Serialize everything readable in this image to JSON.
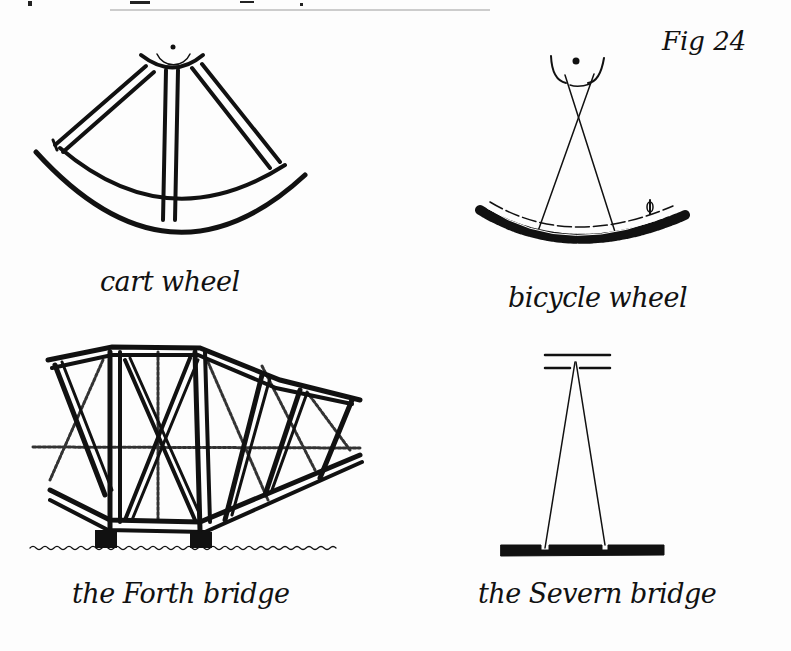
{
  "figure": {
    "label": "Fig 24",
    "ink_color": "#111111",
    "paper_color": "#fdfdfd",
    "panels": [
      {
        "id": "cart-wheel",
        "caption": "cart wheel",
        "description": "Thick wooden spokes in compression radiating from hub to rim"
      },
      {
        "id": "bicycle-wheel",
        "caption": "bicycle wheel",
        "description": "Thin crossed spokes in tension from hub to rim with tyre and valve"
      },
      {
        "id": "forth-bridge",
        "caption": "the Forth bridge",
        "description": "Cantilever truss bridge with heavy steel members over water"
      },
      {
        "id": "severn-bridge",
        "caption": "the Severn bridge",
        "description": "Suspension bridge tower with thin cables to deck"
      }
    ]
  }
}
